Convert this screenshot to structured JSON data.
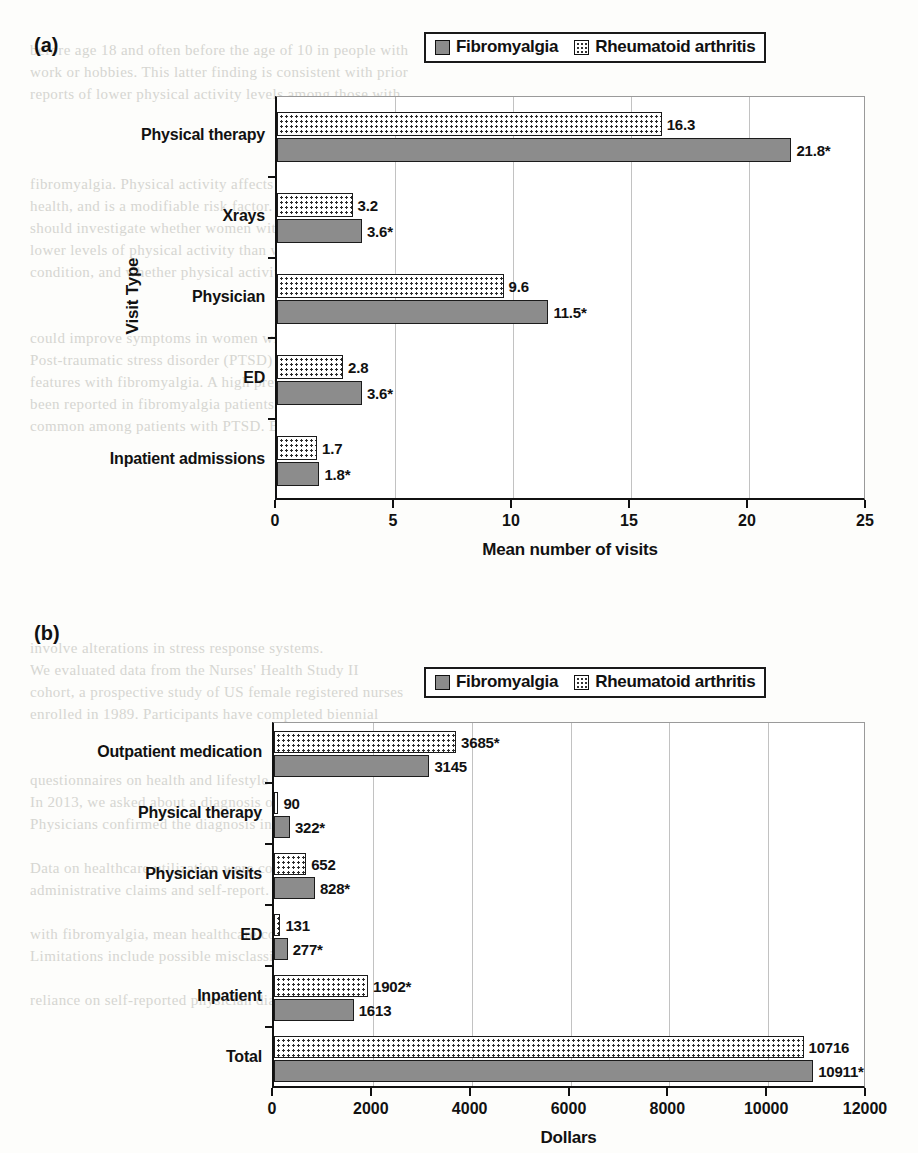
{
  "legend": {
    "series": [
      {
        "name": "Fibromyalgia",
        "pattern": "solid",
        "color": "#8c8c8c"
      },
      {
        "name": "Rheumatoid arthritis",
        "pattern": "dotted",
        "color": "#ffffff"
      }
    ]
  },
  "panels": {
    "a": {
      "letter": "(a)"
    },
    "b": {
      "letter": "(b)"
    }
  },
  "chart_data": [
    {
      "type": "bar",
      "orientation": "horizontal",
      "panel": "(a)",
      "title": "",
      "xlabel": "Mean number of visits",
      "ylabel": "Visit Type",
      "xlim": [
        0,
        25
      ],
      "xticks": [
        0,
        5,
        10,
        15,
        20,
        25
      ],
      "xtick_labels": [
        "0",
        "5",
        "10",
        "15",
        "20",
        "25"
      ],
      "grid": true,
      "legend_position": "top-center",
      "categories": [
        "Physical therapy",
        "Xrays",
        "Physician",
        "ED",
        "Inpatient admissions"
      ],
      "series": [
        {
          "name": "Fibromyalgia",
          "pattern": "solid",
          "values": [
            21.8,
            3.6,
            11.5,
            3.6,
            1.8
          ],
          "labels": [
            "21.8*",
            "3.6*",
            "11.5*",
            "3.6*",
            "1.8*"
          ]
        },
        {
          "name": "Rheumatoid arthritis",
          "pattern": "dotted",
          "values": [
            16.3,
            3.2,
            9.6,
            2.8,
            1.7
          ],
          "labels": [
            "16.3",
            "3.2",
            "9.6",
            "2.8",
            "1.7"
          ]
        }
      ]
    },
    {
      "type": "bar",
      "orientation": "horizontal",
      "panel": "(b)",
      "title": "",
      "xlabel": "Dollars",
      "ylabel": "",
      "xlim": [
        0,
        12000
      ],
      "xticks": [
        0,
        2000,
        4000,
        6000,
        8000,
        10000,
        12000
      ],
      "xtick_labels": [
        "0",
        "2000",
        "4000",
        "6000",
        "8000",
        "10000",
        "12000"
      ],
      "grid": true,
      "legend_position": "top-center",
      "categories": [
        "Outpatient medication",
        "Physical therapy",
        "Physician visits",
        "ED",
        "Inpatient",
        "Total"
      ],
      "series": [
        {
          "name": "Fibromyalgia",
          "pattern": "solid",
          "values": [
            3145,
            322,
            828,
            277,
            1613,
            10911
          ],
          "labels": [
            "3145",
            "322*",
            "828*",
            "277*",
            "1613",
            "10911*"
          ]
        },
        {
          "name": "Rheumatoid arthritis",
          "pattern": "dotted",
          "values": [
            3685,
            90,
            652,
            131,
            1902,
            10716
          ],
          "labels": [
            "3685*",
            "90",
            "652",
            "131",
            "1902*",
            "10716"
          ]
        }
      ]
    }
  ],
  "background_text": [
    "before age 18 and often before the age of 10 in people with",
    "work or hobbies. This latter finding is consistent with prior",
    "reports of lower physical activity levels among those with",
    "fibromyalgia. Physical activity affects many aspects of",
    "health, and is a modifiable risk factor. Future research",
    "should investigate whether women with fibromyalgia have",
    "lower levels of physical activity than women without the",
    "condition, and whether physical activity interventions",
    "could improve symptoms in women with fibromyalgia.",
    "Post-traumatic stress disorder (PTSD) shares many",
    "features with fibromyalgia. A high prevalence of PTSD has",
    "been reported in fibromyalgia patients, and fibromyalgia is",
    "common among patients with PTSD. Both conditions",
    "involve alterations in stress response systems.",
    "We evaluated data from the Nurses' Health Study II",
    "cohort, a prospective study of US female registered nurses",
    "enrolled in 1989. Participants have completed biennial",
    "questionnaires on health and lifestyle factors since then.",
    "In 2013, we asked about a diagnosis of fibromyalgia.",
    "Physicians confirmed the diagnosis in most cases.",
    "Data on healthcare utilization were collected from",
    "administrative claims and self-report. Among women",
    "with fibromyalgia, mean healthcare costs were higher.",
    "Limitations include possible misclassification and the",
    "reliance on self-reported physician diagnoses.",
    "In conclusion, women with fibromyalgia had higher"
  ]
}
